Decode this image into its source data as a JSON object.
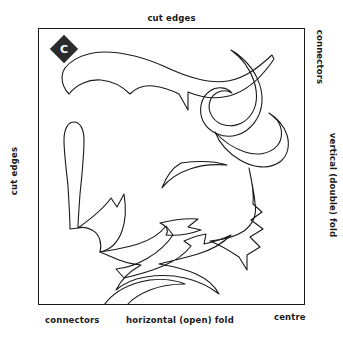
{
  "diagram": {
    "badge": {
      "letter": "C",
      "shape": "diamond",
      "fill_color": "#2b2b2b",
      "text_color": "#ffffff"
    },
    "labels": {
      "top": "cut edges",
      "left": "cut edges",
      "right_top": "connectors",
      "right_middle": "vertical (double) fold",
      "bottom_left": "connectors",
      "bottom_center": "horizontal (open) fold",
      "bottom_right": "centre"
    },
    "colors": {
      "line": "#1a1a1a",
      "background": "#ffffff"
    }
  }
}
